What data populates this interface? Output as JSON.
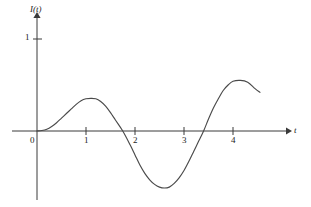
{
  "figure": {
    "background_color": "#ffffff",
    "line_color": "#4a4a4a",
    "axis_color": "#3a3a3a"
  },
  "axes": {
    "y_axis_title": "I(t)",
    "x_axis_title": "t",
    "origin_label": "0",
    "y_tick_labels": [
      "1"
    ],
    "x_tick_labels": [
      "1",
      "2",
      "3",
      "4"
    ]
  },
  "chart_data": {
    "type": "line",
    "title": "",
    "subtitle": "",
    "xlabel": "t",
    "ylabel": "I(t)",
    "xlim": [
      0,
      4.55
    ],
    "ylim": [
      -0.75,
      1.1
    ],
    "grid": false,
    "legend": "none",
    "x_ticks": [
      0,
      1,
      2,
      3,
      4
    ],
    "x_tick_labels": [
      "0",
      "1",
      "2",
      "3",
      "4"
    ],
    "y_ticks": [
      0,
      1
    ],
    "y_tick_labels": [
      "0",
      "1"
    ],
    "annotations": [
      "curve starts at origin (0, 0)",
      "first local maximum near t = 1.2, I = 0.35",
      "zero crossing near t = 1.75",
      "global minimum near t = 2.6, I = -0.62",
      "zero crossing near t = 3.4",
      "second local maximum near t = 4.15, I = 0.55",
      "curve terminates near t = 4.55, I = 0.42"
    ],
    "series": [
      {
        "name": "I(t)",
        "color": "#4a4a4a",
        "x": [
          0.0,
          0.1,
          0.2,
          0.3,
          0.4,
          0.5,
          0.6,
          0.7,
          0.8,
          0.9,
          1.0,
          1.1,
          1.2,
          1.3,
          1.4,
          1.5,
          1.6,
          1.75,
          1.9,
          2.0,
          2.1,
          2.2,
          2.3,
          2.4,
          2.5,
          2.6,
          2.7,
          2.8,
          2.9,
          3.0,
          3.1,
          3.2,
          3.3,
          3.4,
          3.5,
          3.6,
          3.7,
          3.8,
          3.9,
          4.0,
          4.15,
          4.3,
          4.45,
          4.55
        ],
        "y": [
          0.0,
          0.005,
          0.02,
          0.05,
          0.09,
          0.14,
          0.19,
          0.24,
          0.29,
          0.33,
          0.35,
          0.355,
          0.35,
          0.32,
          0.27,
          0.2,
          0.12,
          0.0,
          -0.15,
          -0.26,
          -0.37,
          -0.46,
          -0.53,
          -0.58,
          -0.61,
          -0.62,
          -0.61,
          -0.57,
          -0.51,
          -0.43,
          -0.33,
          -0.22,
          -0.11,
          0.0,
          0.13,
          0.25,
          0.35,
          0.44,
          0.5,
          0.54,
          0.55,
          0.53,
          0.46,
          0.42
        ]
      }
    ]
  }
}
